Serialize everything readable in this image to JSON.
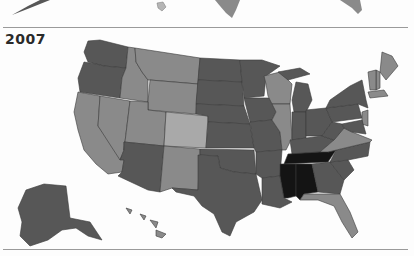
{
  "map": {
    "title": "2007",
    "type": "choropleth",
    "region": "United States",
    "scale_colors": {
      "lightest": "#a9a9a9",
      "light": "#8a8a8a",
      "medium": "#6e6e6e",
      "dark": "#575757",
      "darkest": "#141414"
    },
    "states": [
      {
        "id": "WA",
        "shade": "dark"
      },
      {
        "id": "OR",
        "shade": "dark"
      },
      {
        "id": "CA",
        "shade": "light"
      },
      {
        "id": "NV",
        "shade": "light"
      },
      {
        "id": "ID",
        "shade": "light"
      },
      {
        "id": "MT",
        "shade": "light"
      },
      {
        "id": "WY",
        "shade": "light"
      },
      {
        "id": "UT",
        "shade": "light"
      },
      {
        "id": "AZ",
        "shade": "dark"
      },
      {
        "id": "CO",
        "shade": "lightest"
      },
      {
        "id": "NM",
        "shade": "light"
      },
      {
        "id": "ND",
        "shade": "dark"
      },
      {
        "id": "SD",
        "shade": "dark"
      },
      {
        "id": "NE",
        "shade": "dark"
      },
      {
        "id": "KS",
        "shade": "dark"
      },
      {
        "id": "OK",
        "shade": "dark"
      },
      {
        "id": "TX",
        "shade": "dark"
      },
      {
        "id": "MN",
        "shade": "dark"
      },
      {
        "id": "IA",
        "shade": "dark"
      },
      {
        "id": "MO",
        "shade": "dark"
      },
      {
        "id": "AR",
        "shade": "dark"
      },
      {
        "id": "LA",
        "shade": "dark"
      },
      {
        "id": "WI",
        "shade": "light"
      },
      {
        "id": "IL",
        "shade": "light"
      },
      {
        "id": "MI",
        "shade": "dark"
      },
      {
        "id": "IN",
        "shade": "dark"
      },
      {
        "id": "OH",
        "shade": "dark"
      },
      {
        "id": "KY",
        "shade": "dark"
      },
      {
        "id": "TN",
        "shade": "darkest"
      },
      {
        "id": "MS",
        "shade": "darkest"
      },
      {
        "id": "AL",
        "shade": "darkest"
      },
      {
        "id": "GA",
        "shade": "dark"
      },
      {
        "id": "FL",
        "shade": "light"
      },
      {
        "id": "SC",
        "shade": "dark"
      },
      {
        "id": "NC",
        "shade": "dark"
      },
      {
        "id": "VA",
        "shade": "light"
      },
      {
        "id": "WV",
        "shade": "dark"
      },
      {
        "id": "PA",
        "shade": "dark"
      },
      {
        "id": "NY",
        "shade": "dark"
      },
      {
        "id": "ME",
        "shade": "light"
      },
      {
        "id": "NH",
        "shade": "light"
      },
      {
        "id": "VT",
        "shade": "light"
      },
      {
        "id": "MA",
        "shade": "light"
      },
      {
        "id": "NJ",
        "shade": "light"
      },
      {
        "id": "MD",
        "shade": "dark"
      },
      {
        "id": "AK",
        "shade": "dark"
      },
      {
        "id": "HI",
        "shade": "light"
      }
    ]
  },
  "previous_map_fragment": {
    "visible_states": [
      "AK",
      "HI",
      "TX",
      "FL"
    ]
  }
}
